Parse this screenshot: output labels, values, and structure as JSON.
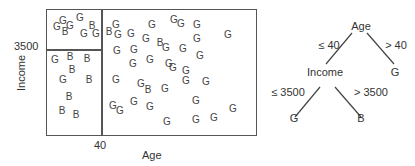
{
  "plot": {
    "x_axis_label": "Age",
    "y_axis_label": "Income",
    "x_split_tick": "40",
    "y_split_tick": "3500",
    "points": [
      {
        "c": "G",
        "x": 63,
        "y": 21
      },
      {
        "c": "G",
        "x": 57,
        "y": 27
      },
      {
        "c": "G",
        "x": 70,
        "y": 26
      },
      {
        "c": "G",
        "x": 80,
        "y": 18
      },
      {
        "c": "B",
        "x": 92,
        "y": 26
      },
      {
        "c": "B",
        "x": 65,
        "y": 32
      },
      {
        "c": "G",
        "x": 84,
        "y": 34
      },
      {
        "c": "G",
        "x": 96,
        "y": 34
      },
      {
        "c": "G",
        "x": 55,
        "y": 60
      },
      {
        "c": "B",
        "x": 70,
        "y": 57
      },
      {
        "c": "B",
        "x": 87,
        "y": 59
      },
      {
        "c": "B",
        "x": 72,
        "y": 70
      },
      {
        "c": "G",
        "x": 63,
        "y": 80
      },
      {
        "c": "B",
        "x": 89,
        "y": 80
      },
      {
        "c": "B",
        "x": 69,
        "y": 97
      },
      {
        "c": "B",
        "x": 62,
        "y": 111
      },
      {
        "c": "B",
        "x": 76,
        "y": 115
      },
      {
        "c": "G",
        "x": 116,
        "y": 25
      },
      {
        "c": "B",
        "x": 109,
        "y": 32
      },
      {
        "c": "G",
        "x": 118,
        "y": 35
      },
      {
        "c": "G",
        "x": 131,
        "y": 34
      },
      {
        "c": "G",
        "x": 152,
        "y": 25
      },
      {
        "c": "G",
        "x": 146,
        "y": 39
      },
      {
        "c": "B",
        "x": 160,
        "y": 43
      },
      {
        "c": "G",
        "x": 166,
        "y": 48
      },
      {
        "c": "G",
        "x": 117,
        "y": 51
      },
      {
        "c": "G",
        "x": 134,
        "y": 50
      },
      {
        "c": "G",
        "x": 133,
        "y": 64
      },
      {
        "c": "G",
        "x": 150,
        "y": 60
      },
      {
        "c": "G",
        "x": 169,
        "y": 64
      },
      {
        "c": "G",
        "x": 174,
        "y": 20
      },
      {
        "c": "G",
        "x": 181,
        "y": 24
      },
      {
        "c": "G",
        "x": 197,
        "y": 25
      },
      {
        "c": "G",
        "x": 228,
        "y": 35
      },
      {
        "c": "G",
        "x": 197,
        "y": 39
      },
      {
        "c": "G",
        "x": 183,
        "y": 49
      },
      {
        "c": "G",
        "x": 200,
        "y": 56
      },
      {
        "c": "G",
        "x": 173,
        "y": 68
      },
      {
        "c": "G",
        "x": 116,
        "y": 80
      },
      {
        "c": "G",
        "x": 141,
        "y": 84
      },
      {
        "c": "B",
        "x": 148,
        "y": 90
      },
      {
        "c": "G",
        "x": 165,
        "y": 89
      },
      {
        "c": "G",
        "x": 113,
        "y": 106
      },
      {
        "c": "G",
        "x": 120,
        "y": 111
      },
      {
        "c": "G",
        "x": 134,
        "y": 102
      },
      {
        "c": "G",
        "x": 150,
        "y": 107
      },
      {
        "c": "G",
        "x": 167,
        "y": 122
      },
      {
        "c": "G",
        "x": 186,
        "y": 71
      },
      {
        "c": "G",
        "x": 186,
        "y": 81
      },
      {
        "c": "G",
        "x": 206,
        "y": 82
      },
      {
        "c": "G",
        "x": 196,
        "y": 101
      },
      {
        "c": "G",
        "x": 196,
        "y": 120
      },
      {
        "c": "G",
        "x": 214,
        "y": 118
      },
      {
        "c": "G",
        "x": 233,
        "y": 109
      }
    ]
  },
  "tree": {
    "root": "Age",
    "root_left_edge": "≤ 40",
    "root_right_edge": "> 40",
    "left_child": "Income",
    "right_leaf": "G",
    "income_left_edge": "≤ 3500",
    "income_right_edge": "> 3500",
    "income_left_leaf": "G",
    "income_right_leaf": "B"
  }
}
